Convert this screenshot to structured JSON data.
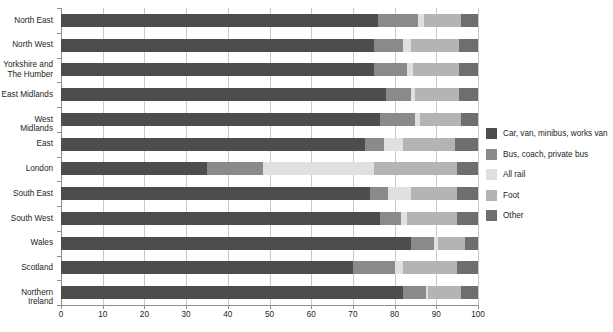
{
  "chart_data": {
    "type": "bar",
    "orientation": "horizontal",
    "stacked": true,
    "title": "",
    "subtitle": "",
    "xlabel": "",
    "ylabel": "",
    "xlim": [
      0,
      100
    ],
    "xticks": [
      0,
      10,
      20,
      30,
      40,
      50,
      60,
      70,
      80,
      90,
      100
    ],
    "xtick_labels": [
      "0",
      "10",
      "20",
      "30",
      "40",
      "50",
      "60",
      "70",
      "80",
      "90",
      "100"
    ],
    "grid": true,
    "grid_axis": "x",
    "legend_position": "right",
    "categories": [
      "North East",
      "North West",
      "Yorkshire and\nThe Humber",
      "East Midlands",
      "West Midlands",
      "East",
      "London",
      "South East",
      "South West",
      "Wales",
      "Scotland",
      "Northern Ireland"
    ],
    "series": [
      {
        "name": "Car, van, minibus, works van",
        "color": "#4d4d4d",
        "values": [
          76.0,
          75.0,
          75.0,
          78.0,
          76.5,
          73.0,
          35.0,
          74.0,
          76.5,
          84.0,
          70.0,
          82.0
        ]
      },
      {
        "name": "Bus, coach, private bus",
        "color": "#8a8a8a",
        "values": [
          9.5,
          7.0,
          8.0,
          6.0,
          8.5,
          4.5,
          13.5,
          4.5,
          5.0,
          5.5,
          10.0,
          5.5
        ]
      },
      {
        "name": "All rail",
        "color": "#e0e0e0",
        "values": [
          1.5,
          2.0,
          1.5,
          1.0,
          1.0,
          4.5,
          26.5,
          5.5,
          1.5,
          1.0,
          2.0,
          0.5
        ]
      },
      {
        "name": "Foot",
        "color": "#b4b4b4",
        "values": [
          9.0,
          11.5,
          11.0,
          10.5,
          10.0,
          12.5,
          20.0,
          11.0,
          12.0,
          6.5,
          13.0,
          8.0
        ]
      },
      {
        "name": "Other",
        "color": "#6e6e6e",
        "values": [
          4.0,
          4.5,
          4.5,
          4.5,
          4.0,
          5.5,
          5.0,
          5.0,
          5.0,
          3.0,
          5.0,
          4.0
        ]
      }
    ]
  },
  "legend": {
    "items": [
      {
        "label": "Car, van, minibus, works van",
        "color": "#4d4d4d"
      },
      {
        "label": "Bus, coach, private bus",
        "color": "#8a8a8a"
      },
      {
        "label": "All rail",
        "color": "#e0e0e0"
      },
      {
        "label": "Foot",
        "color": "#b4b4b4"
      },
      {
        "label": "Other",
        "color": "#6e6e6e"
      }
    ]
  },
  "style": {
    "background": "#ffffff",
    "grid_color": "#c9c9c9",
    "axis_color": "#8d8d8d",
    "text_color": "#231f20"
  }
}
